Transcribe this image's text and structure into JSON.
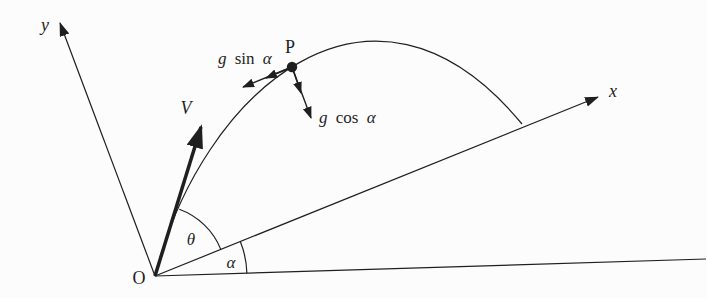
{
  "figure": {
    "colors": {
      "ink": "#1f1f1f",
      "background": "#fcfcfc"
    },
    "labels": {
      "origin": "O",
      "y_axis": "y",
      "x_axis": "x",
      "velocity": "V",
      "point": "P",
      "launch_angle": "θ",
      "incline_angle": "α",
      "g_tangential": {
        "coeff": "g",
        "fn": "sin",
        "angle": "α"
      },
      "g_normal": {
        "coeff": "g",
        "fn": "cos",
        "angle": "α"
      }
    }
  }
}
